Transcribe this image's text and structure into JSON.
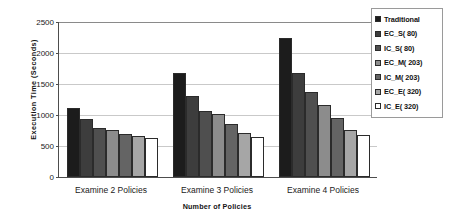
{
  "chart_data": {
    "type": "bar",
    "title": "",
    "xlabel": "Number of Policies",
    "ylabel": "Execution Time (Seconds)",
    "ylim": [
      0,
      2500
    ],
    "ytick_step": 500,
    "yticks": [
      "2500",
      "2000",
      "1500",
      "1000",
      "500",
      "0"
    ],
    "grid": true,
    "legend_position": "top-right",
    "categories": [
      "Examine 2 Policies",
      "Examine 3 Policies",
      "Examine 4 Policies"
    ],
    "series": [
      {
        "name": "Traditional",
        "color": "#1c1c1c",
        "values": [
          1110,
          1670,
          2245
        ]
      },
      {
        "name": "EC_S( 80)",
        "color": "#3d3d3d",
        "values": [
          935,
          1300,
          1670
        ]
      },
      {
        "name": "IC_S( 80)",
        "color": "#4f4f4f",
        "values": [
          790,
          1065,
          1370
        ]
      },
      {
        "name": "EC_M( 203)",
        "color": "#8c8c8c",
        "values": [
          760,
          1010,
          1155
        ]
      },
      {
        "name": "IC_M( 203)",
        "color": "#646464",
        "values": [
          695,
          850,
          945
        ]
      },
      {
        "name": "EC_E( 320)",
        "color": "#a6a6a6",
        "values": [
          660,
          715,
          760
        ]
      },
      {
        "name": "IC_E( 320)",
        "color": "#ffffff",
        "values": [
          630,
          645,
          685
        ]
      }
    ]
  },
  "legend": {
    "items": [
      {
        "label": "Traditional"
      },
      {
        "label": "EC_S( 80)"
      },
      {
        "label": "IC_S( 80)"
      },
      {
        "label": "EC_M( 203)"
      },
      {
        "label": "IC_M( 203)"
      },
      {
        "label": "EC_E( 320)"
      },
      {
        "label": "IC_E( 320)"
      }
    ]
  }
}
